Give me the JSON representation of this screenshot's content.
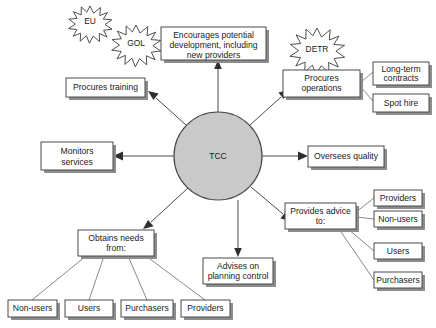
{
  "diagram": {
    "hub": {
      "label": "TCC",
      "cx": 218,
      "cy": 156,
      "r": 44,
      "fill": "#c9c9c9",
      "stroke": "#4a4a4a"
    },
    "bursts": [
      {
        "id": "burst-eu",
        "label": "EU",
        "cx": 90,
        "cy": 21,
        "r": 15
      },
      {
        "id": "burst-gol",
        "label": "GOL",
        "cx": 136,
        "cy": 42,
        "r": 17
      },
      {
        "id": "burst-detr",
        "label": "DETR",
        "cx": 317,
        "cy": 47,
        "r": 19
      }
    ],
    "nodes": [
      {
        "id": "node-encourages-development",
        "lines": [
          "Encourages potential",
          "development, including",
          "new providers"
        ],
        "x": 161,
        "y": 27,
        "w": 105,
        "h": 33
      },
      {
        "id": "node-procures-training",
        "lines": [
          "Procures training"
        ],
        "x": 66,
        "y": 78,
        "w": 79,
        "h": 19
      },
      {
        "id": "node-procures-operations",
        "lines": [
          "Procures",
          "operations"
        ],
        "x": 283,
        "y": 70,
        "w": 77,
        "h": 27
      },
      {
        "id": "node-long-term-contracts",
        "lines": [
          "Long-term",
          "contracts"
        ],
        "x": 373,
        "y": 62,
        "w": 56,
        "h": 23
      },
      {
        "id": "node-spot-hire",
        "lines": [
          "Spot hire"
        ],
        "x": 373,
        "y": 94,
        "w": 56,
        "h": 18
      },
      {
        "id": "node-monitors-services",
        "lines": [
          "Monitors",
          "services"
        ],
        "x": 41,
        "y": 142,
        "w": 72,
        "h": 28
      },
      {
        "id": "node-oversees-quality",
        "lines": [
          "Oversees quality"
        ],
        "x": 308,
        "y": 146,
        "w": 76,
        "h": 21
      },
      {
        "id": "node-obtains-needs",
        "lines": [
          "Obtains needs",
          "from:"
        ],
        "x": 78,
        "y": 230,
        "w": 76,
        "h": 26
      },
      {
        "id": "node-advises-planning",
        "lines": [
          "Advises on",
          "planning control"
        ],
        "x": 203,
        "y": 258,
        "w": 70,
        "h": 26
      },
      {
        "id": "node-provides-advice",
        "lines": [
          "Provides advice",
          "to:"
        ],
        "x": 285,
        "y": 203,
        "w": 71,
        "h": 26
      },
      {
        "id": "node-advice-providers",
        "lines": [
          "Providers"
        ],
        "x": 374,
        "y": 190,
        "w": 48,
        "h": 16
      },
      {
        "id": "node-advice-non-users",
        "lines": [
          "Non-users"
        ],
        "x": 374,
        "y": 211,
        "w": 48,
        "h": 16
      },
      {
        "id": "node-advice-users",
        "lines": [
          "Users"
        ],
        "x": 374,
        "y": 243,
        "w": 48,
        "h": 16
      },
      {
        "id": "node-advice-purchasers",
        "lines": [
          "Purchasers"
        ],
        "x": 374,
        "y": 272,
        "w": 48,
        "h": 16
      },
      {
        "id": "node-needs-non-users",
        "lines": [
          "Non-users"
        ],
        "x": 8,
        "y": 300,
        "w": 49,
        "h": 17
      },
      {
        "id": "node-needs-users",
        "lines": [
          "Users"
        ],
        "x": 65,
        "y": 300,
        "w": 48,
        "h": 17
      },
      {
        "id": "node-needs-purchasers",
        "lines": [
          "Purchasers"
        ],
        "x": 121,
        "y": 300,
        "w": 52,
        "h": 17
      },
      {
        "id": "node-needs-providers",
        "lines": [
          "Providers"
        ],
        "x": 181,
        "y": 300,
        "w": 49,
        "h": 17
      }
    ],
    "edges": [
      {
        "id": "edge-hub-to-encourages",
        "from": "TCC",
        "to": "Encourages potential development, including new providers"
      },
      {
        "id": "edge-hub-to-training",
        "from": "TCC",
        "to": "Procures training"
      },
      {
        "id": "edge-hub-to-operations",
        "from": "TCC",
        "to": "Procures operations"
      },
      {
        "id": "edge-hub-to-monitors",
        "from": "TCC",
        "to": "Monitors services"
      },
      {
        "id": "edge-hub-to-quality",
        "from": "TCC",
        "to": "Oversees quality"
      },
      {
        "id": "edge-hub-to-needs",
        "from": "TCC",
        "to": "Obtains needs from:"
      },
      {
        "id": "edge-hub-to-planning",
        "from": "TCC",
        "to": "Advises on planning control"
      },
      {
        "id": "edge-hub-to-advice",
        "from": "TCC",
        "to": "Provides advice to:"
      },
      {
        "id": "edge-ops-to-contracts",
        "from": "Procures operations",
        "to": "Long-term contracts"
      },
      {
        "id": "edge-ops-to-spot",
        "from": "Procures operations",
        "to": "Spot hire"
      },
      {
        "id": "edge-advice-providers",
        "from": "Provides advice to:",
        "to": "Providers"
      },
      {
        "id": "edge-advice-non-users",
        "from": "Provides advice to:",
        "to": "Non-users"
      },
      {
        "id": "edge-advice-users",
        "from": "Provides advice to:",
        "to": "Users"
      },
      {
        "id": "edge-advice-purchasers",
        "from": "Provides advice to:",
        "to": "Purchasers"
      },
      {
        "id": "edge-needs-non-users",
        "from": "Obtains needs from:",
        "to": "Non-users"
      },
      {
        "id": "edge-needs-users",
        "from": "Obtains needs from:",
        "to": "Users"
      },
      {
        "id": "edge-needs-purchasers",
        "from": "Obtains needs from:",
        "to": "Purchasers"
      },
      {
        "id": "edge-needs-providers",
        "from": "Obtains needs from:",
        "to": "Providers"
      }
    ]
  }
}
